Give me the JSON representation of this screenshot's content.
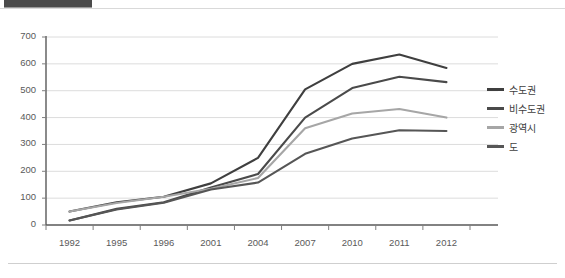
{
  "header": {
    "bar_title": ""
  },
  "chart_data": {
    "type": "line",
    "title": "",
    "subtitle": "",
    "xlabel": "",
    "ylabel": "",
    "categories": [
      "1992",
      "1995",
      "1996",
      "2001",
      "2004",
      "2007",
      "2010",
      "2011",
      "2012"
    ],
    "ylim": [
      0,
      700
    ],
    "ytick_step": 100,
    "yticks": [
      "700",
      "600",
      "500",
      "400",
      "300",
      "200",
      "100",
      "0"
    ],
    "grid": true,
    "legend_position": "right",
    "series": [
      {
        "name": "수도권",
        "color": "#3f3f3f",
        "values": [
          50,
          85,
          105,
          155,
          250,
          505,
          600,
          635,
          585
        ]
      },
      {
        "name": "비수도권",
        "color": "#4a4a4a",
        "values": [
          17,
          60,
          85,
          140,
          190,
          400,
          510,
          552,
          532
        ]
      },
      {
        "name": "광역시",
        "color": "#a6a6a6",
        "values": [
          50,
          82,
          105,
          135,
          175,
          360,
          415,
          432,
          400
        ]
      },
      {
        "name": "도",
        "color": "#565656",
        "values": [
          17,
          58,
          83,
          132,
          158,
          265,
          322,
          353,
          350
        ]
      }
    ]
  },
  "colors": {
    "axis": "#7f7f7f",
    "grid": "#dcdcdc",
    "tick_text": "#5a5a5a",
    "legend_text": "#404040",
    "header_bar": "#4b4b4b"
  }
}
